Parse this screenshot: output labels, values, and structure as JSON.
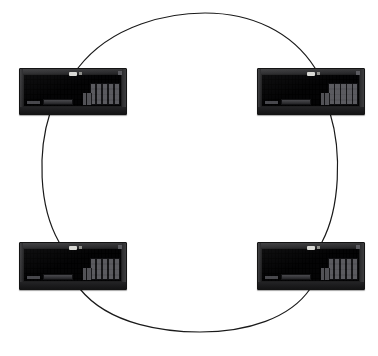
{
  "diagram": {
    "type": "ring-topology",
    "background_color": "#ffffff",
    "canvas": {
      "width": 378,
      "height": 356
    },
    "ring": {
      "shape": "ellipse",
      "center_x": 188,
      "center_y": 172,
      "radius_x": 150,
      "radius_y": 160,
      "stroke_color": "#1a1a1a",
      "stroke_width": 1.2,
      "fill": "none"
    },
    "nodes": [
      {
        "id": "node-top-left",
        "label": "",
        "device": "keyboard",
        "position": "top-left",
        "x": 19,
        "y": 68,
        "width": 106,
        "height": 45,
        "body_color": "#1f1f20",
        "key_color": "#46464a",
        "led_color": "#d8d8d4"
      },
      {
        "id": "node-top-right",
        "label": "",
        "device": "keyboard",
        "position": "top-right",
        "x": 257,
        "y": 68,
        "width": 106,
        "height": 45,
        "body_color": "#1f1f20",
        "key_color": "#46464a",
        "led_color": "#d8d8d4"
      },
      {
        "id": "node-bottom-left",
        "label": "",
        "device": "keyboard",
        "position": "bottom-left",
        "x": 19,
        "y": 242,
        "width": 106,
        "height": 46,
        "body_color": "#1f1f20",
        "key_color": "#46464a",
        "led_color": "#d8d8d4"
      },
      {
        "id": "node-bottom-right",
        "label": "",
        "device": "keyboard",
        "position": "bottom-right",
        "x": 257,
        "y": 242,
        "width": 106,
        "height": 46,
        "body_color": "#1f1f20",
        "key_color": "#46464a",
        "led_color": "#d8d8d4"
      }
    ],
    "connections": [
      {
        "id": "link-top",
        "from": "node-top-left",
        "to": "node-top-right",
        "style": "curved-arc"
      },
      {
        "id": "link-right",
        "from": "node-top-right",
        "to": "node-bottom-right",
        "style": "curved-arc"
      },
      {
        "id": "link-bottom",
        "from": "node-bottom-right",
        "to": "node-bottom-left",
        "style": "curved-arc"
      },
      {
        "id": "link-left",
        "from": "node-bottom-left",
        "to": "node-top-left",
        "style": "curved-arc"
      }
    ]
  }
}
